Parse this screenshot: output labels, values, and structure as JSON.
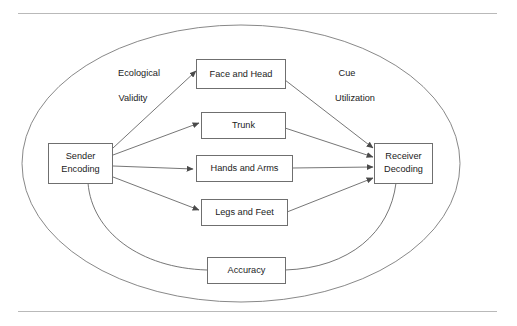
{
  "figure": {
    "title_text": "",
    "boundary_shape_name": "outer-ellipse"
  },
  "nodes": {
    "sender": {
      "line1": "Sender",
      "line2": "Encoding"
    },
    "face": {
      "label": "Face and Head"
    },
    "trunk": {
      "label": "Trunk"
    },
    "hands": {
      "label": "Hands and Arms"
    },
    "legs": {
      "label": "Legs and Feet"
    },
    "accuracy": {
      "label": "Accuracy"
    },
    "receiver": {
      "line1": "Receiver",
      "line2": "Decoding"
    }
  },
  "annotations": {
    "left_line1": "Ecological",
    "left_line2": "Validity",
    "right_line1": "Cue",
    "right_line2": "Utilization"
  },
  "colors": {
    "stroke": "#5d5d5d",
    "box_stroke": "#6f6f6f",
    "ellipse_stroke": "#7a7a7a",
    "rule": "#b9b9b9",
    "text": "#1b1b1b",
    "background": "#ffffff"
  },
  "edges": [
    {
      "from": "sender",
      "to": "face",
      "arrow": true
    },
    {
      "from": "sender",
      "to": "trunk",
      "arrow": true
    },
    {
      "from": "sender",
      "to": "hands",
      "arrow": true
    },
    {
      "from": "sender",
      "to": "legs",
      "arrow": true
    },
    {
      "from": "sender",
      "to": "accuracy",
      "arrow": false
    },
    {
      "from": "face",
      "to": "receiver",
      "arrow": true
    },
    {
      "from": "trunk",
      "to": "receiver",
      "arrow": true
    },
    {
      "from": "hands",
      "to": "receiver",
      "arrow": true
    },
    {
      "from": "legs",
      "to": "receiver",
      "arrow": true
    },
    {
      "from": "accuracy",
      "to": "receiver",
      "arrow": false
    }
  ]
}
